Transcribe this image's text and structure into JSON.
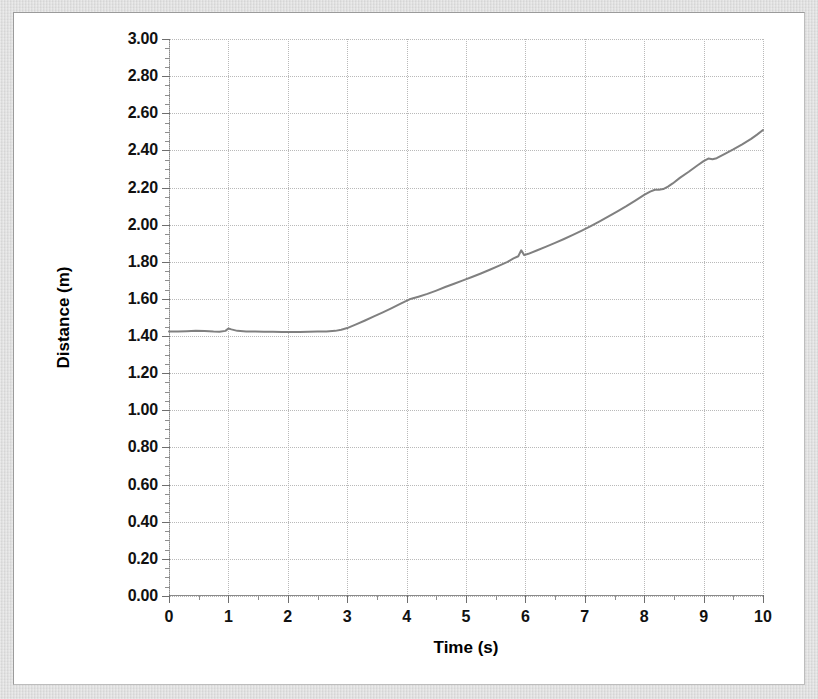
{
  "figure": {
    "background_color": "#dcdcdc",
    "card_color": "#ffffff",
    "border_color": "#9b9b9b"
  },
  "chart_data": {
    "type": "line",
    "title": "",
    "xlabel": "Time (s)",
    "ylabel": "Distance (m)",
    "xlim": [
      0,
      10
    ],
    "ylim": [
      0,
      3.0
    ],
    "grid": true,
    "legend": "none",
    "line_color": "#808080",
    "line_width": 2,
    "x_major_ticks": [
      0,
      1,
      2,
      3,
      4,
      5,
      6,
      7,
      8,
      9,
      10
    ],
    "x_tick_labels": [
      "0",
      "1",
      "2",
      "3",
      "4",
      "5",
      "6",
      "7",
      "8",
      "9",
      "10"
    ],
    "x_minor_step": 0.5,
    "y_major_ticks": [
      0.0,
      0.2,
      0.4,
      0.6,
      0.8,
      1.0,
      1.2,
      1.4,
      1.6,
      1.8,
      2.0,
      2.2,
      2.4,
      2.6,
      2.8,
      3.0
    ],
    "y_tick_labels": [
      "0.00",
      "0.20",
      "0.40",
      "0.60",
      "0.80",
      "1.00",
      "1.20",
      "1.40",
      "1.60",
      "1.80",
      "2.00",
      "2.20",
      "2.40",
      "2.60",
      "2.80",
      "3.00"
    ],
    "y_minor_step": 0.05,
    "series": [
      {
        "name": "Distance vs Time",
        "x": [
          0.0,
          0.15,
          0.3,
          0.45,
          0.6,
          0.75,
          0.85,
          0.95,
          1.0,
          1.05,
          1.15,
          1.3,
          1.45,
          1.6,
          1.75,
          1.9,
          2.05,
          2.2,
          2.35,
          2.5,
          2.65,
          2.8,
          2.9,
          3.0,
          3.15,
          3.3,
          3.45,
          3.6,
          3.75,
          3.9,
          4.05,
          4.2,
          4.35,
          4.5,
          4.65,
          4.8,
          4.95,
          5.1,
          5.25,
          5.4,
          5.55,
          5.7,
          5.8,
          5.88,
          5.93,
          5.98,
          6.05,
          6.2,
          6.35,
          6.5,
          6.65,
          6.8,
          6.95,
          7.1,
          7.25,
          7.4,
          7.55,
          7.7,
          7.85,
          8.0,
          8.1,
          8.18,
          8.25,
          8.32,
          8.4,
          8.48,
          8.6,
          8.75,
          8.9,
          9.0,
          9.08,
          9.15,
          9.22,
          9.35,
          9.5,
          9.65,
          9.8,
          9.9,
          10.0
        ],
        "y": [
          1.425,
          1.425,
          1.426,
          1.428,
          1.427,
          1.424,
          1.423,
          1.428,
          1.441,
          1.436,
          1.428,
          1.425,
          1.424,
          1.423,
          1.423,
          1.422,
          1.422,
          1.422,
          1.423,
          1.424,
          1.425,
          1.428,
          1.434,
          1.443,
          1.463,
          1.484,
          1.506,
          1.528,
          1.551,
          1.575,
          1.598,
          1.612,
          1.627,
          1.645,
          1.664,
          1.682,
          1.7,
          1.718,
          1.737,
          1.757,
          1.778,
          1.8,
          1.818,
          1.83,
          1.862,
          1.836,
          1.843,
          1.862,
          1.882,
          1.902,
          1.923,
          1.945,
          1.968,
          1.992,
          2.018,
          2.045,
          2.072,
          2.1,
          2.13,
          2.16,
          2.178,
          2.188,
          2.188,
          2.192,
          2.205,
          2.222,
          2.252,
          2.285,
          2.32,
          2.342,
          2.356,
          2.352,
          2.358,
          2.38,
          2.405,
          2.432,
          2.462,
          2.485,
          2.51
        ]
      }
    ]
  }
}
